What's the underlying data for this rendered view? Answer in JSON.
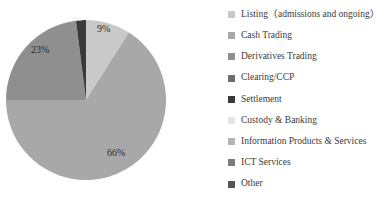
{
  "chart_data": {
    "type": "pie",
    "title": "",
    "legend_position": "right",
    "grid": false,
    "categories": [
      "Listing（admissions and ongoing）",
      "Cash Trading",
      "Derivatives Trading",
      "Clearing/CCP",
      "Settlement",
      "Custody & Banking",
      "Information Products & Services",
      "ICT Services",
      "Other"
    ],
    "values": [
      9,
      66,
      23,
      0,
      2,
      0,
      0,
      0,
      0
    ],
    "value_labels": [
      "9%",
      "66%",
      "23%",
      "",
      "2%",
      "",
      "",
      "",
      ""
    ],
    "colors": [
      "#c9c9c9",
      "#a8a8a8",
      "#8f8f8f",
      "#6e6e6e",
      "#3a3a3a",
      "#e4e4e4",
      "#b4b4b4",
      "#7c7c7c",
      "#555555"
    ],
    "visible_labels": [
      {
        "text": "9%",
        "x": 97,
        "y": 24
      },
      {
        "text": "23%",
        "x": 31,
        "y": 45
      },
      {
        "text": "66%",
        "x": 107,
        "y": 148
      },
      {
        "text": "2%",
        "x": 72,
        "y": 16
      }
    ]
  },
  "legend": {
    "items": [
      {
        "label": "Listing（admissions and ongoing）",
        "color": "#c9c9c9"
      },
      {
        "label": "Cash Trading",
        "color": "#a8a8a8"
      },
      {
        "label": "Derivatives Trading",
        "color": "#8f8f8f"
      },
      {
        "label": "Clearing/CCP",
        "color": "#6e6e6e"
      },
      {
        "label": "Settlement",
        "color": "#3a3a3a"
      },
      {
        "label": "Custody & Banking",
        "color": "#e4e4e4"
      },
      {
        "label": "Information Products & Services",
        "color": "#b4b4b4"
      },
      {
        "label": "ICT Services",
        "color": "#7c7c7c"
      },
      {
        "label": "Other",
        "color": "#555555"
      }
    ]
  },
  "pie_geometry": {
    "cx": 86,
    "cy": 100,
    "r": 80
  }
}
